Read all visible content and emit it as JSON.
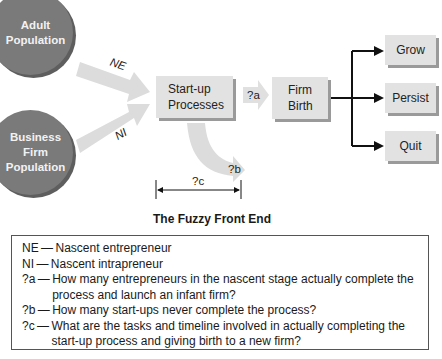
{
  "diagram": {
    "sources": [
      {
        "id": "adult",
        "label": "Adult Population",
        "lines": [
          "Adult",
          "Population"
        ]
      },
      {
        "id": "business",
        "label": "Business Firm Population",
        "lines": [
          "Business",
          "Firm",
          "Population"
        ]
      }
    ],
    "flows": [
      {
        "from": "adult",
        "to": "startup",
        "label": "NE"
      },
      {
        "from": "business",
        "to": "startup",
        "label": "NI"
      },
      {
        "from": "startup",
        "to": "birth",
        "label": "?a"
      },
      {
        "from": "startup",
        "to": "dropout",
        "label": "?b"
      }
    ],
    "nodes": {
      "startup": {
        "lines": [
          "Start-up",
          "Processes"
        ]
      },
      "birth": {
        "lines": [
          "Firm",
          "Birth"
        ]
      }
    },
    "outcomes": [
      "Grow",
      "Persist",
      "Quit"
    ],
    "timeline": {
      "label": "?c"
    },
    "caption": "The Fuzzy Front End",
    "colors": {
      "circle": "#7a7a7a",
      "box": "#e2e2e2",
      "arrow": "#dcdcdc"
    }
  },
  "legend": [
    {
      "key": "NE",
      "text": "Nascent entrepreneur"
    },
    {
      "key": "NI",
      "text": "Nascent intrapreneur"
    },
    {
      "key": "?a",
      "text": "How many entrepreneurs in the nascent stage actually complete the process and launch an infant firm?"
    },
    {
      "key": "?b",
      "text": "How many start-ups never complete the process?"
    },
    {
      "key": "?c",
      "text": "What are the tasks and timeline involved in actually completing the start-up process and giving birth to a new firm?"
    }
  ]
}
